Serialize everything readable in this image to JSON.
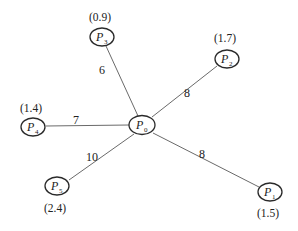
{
  "diagram": {
    "type": "star-graph",
    "center": "P0",
    "nodes": [
      {
        "id": "P0",
        "name": "P",
        "sub": "0",
        "coord": ""
      },
      {
        "id": "P1",
        "name": "P",
        "sub": "1",
        "coord": "(1.5)"
      },
      {
        "id": "P2",
        "name": "P",
        "sub": "2",
        "coord": "(1.7)"
      },
      {
        "id": "P3",
        "name": "P",
        "sub": "3",
        "coord": "(0.9)"
      },
      {
        "id": "P4",
        "name": "P",
        "sub": "4",
        "coord": "(1.4)"
      },
      {
        "id": "P5",
        "name": "P",
        "sub": "5",
        "coord": "(2.4)"
      }
    ],
    "edges": [
      {
        "from": "P0",
        "to": "P3",
        "weight": "6"
      },
      {
        "from": "P0",
        "to": "P2",
        "weight": "8"
      },
      {
        "from": "P0",
        "to": "P4",
        "weight": "7"
      },
      {
        "from": "P0",
        "to": "P5",
        "weight": "10"
      },
      {
        "from": "P0",
        "to": "P1",
        "weight": "8"
      }
    ]
  }
}
